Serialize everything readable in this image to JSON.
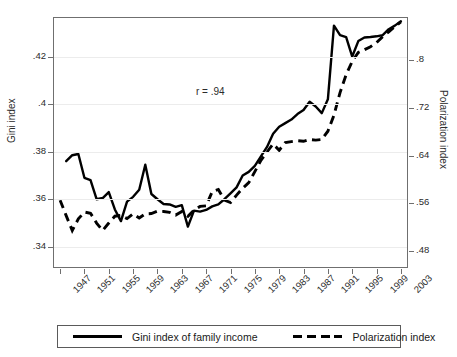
{
  "chart_data": {
    "type": "line",
    "title": "",
    "subtitle": "",
    "xlabel": "",
    "ylabel": "Gini index",
    "ylabel_secondary": "Polarization index",
    "grid": true,
    "legend_position": "bottom",
    "annotations": [
      {
        "name": "correlation",
        "text": "r = .94",
        "x": 1971,
        "y": 0.4045
      }
    ],
    "x": [
      1947,
      1948,
      1949,
      1950,
      1951,
      1952,
      1953,
      1954,
      1955,
      1956,
      1957,
      1958,
      1959,
      1960,
      1961,
      1962,
      1963,
      1964,
      1965,
      1966,
      1967,
      1968,
      1969,
      1970,
      1971,
      1972,
      1973,
      1974,
      1975,
      1976,
      1977,
      1978,
      1979,
      1980,
      1981,
      1982,
      1983,
      1984,
      1985,
      1986,
      1987,
      1988,
      1989,
      1990,
      1991,
      1992,
      1993,
      1994,
      1995,
      1996,
      1997,
      1998,
      1999,
      2000,
      2001,
      2002,
      2003
    ],
    "xtick_labels": [
      "1947",
      "1951",
      "1955",
      "1959",
      "1963",
      "1967",
      "1971",
      "1975",
      "1979",
      "1983",
      "1987",
      "1991",
      "1995",
      "1999",
      "2003"
    ],
    "xtick_values": [
      1947,
      1951,
      1955,
      1959,
      1963,
      1967,
      1971,
      1975,
      1979,
      1983,
      1987,
      1991,
      1995,
      1999,
      2003
    ],
    "xlim": [
      1946,
      2004
    ],
    "axes": [
      {
        "name": "left-axis",
        "label": "Gini index",
        "ylim": [
          0.3315,
          0.4362
        ],
        "ytick_labels": [
          ".42",
          ".4",
          ".38",
          ".36",
          ".34"
        ],
        "ytick_values": [
          0.42,
          0.4,
          0.38,
          0.36,
          0.34
        ]
      },
      {
        "name": "right-axis",
        "label": "Polarization index",
        "ylim": [
          0.4526,
          0.8714
        ],
        "ytick_labels": [
          ".8",
          ".72",
          ".64",
          ".56",
          ".48"
        ],
        "ytick_values": [
          0.8,
          0.72,
          0.64,
          0.56,
          0.48
        ]
      }
    ],
    "series": [
      {
        "name": "Gini index of family income",
        "axis": "left",
        "style": "solid",
        "color": "#000000",
        "start_year": 1948,
        "values": [
          null,
          0.376,
          0.3785,
          0.379,
          0.369,
          0.368,
          0.36,
          0.3605,
          0.363,
          0.3557,
          0.3508,
          0.359,
          0.361,
          0.364,
          0.3745,
          0.3622,
          0.36,
          0.358,
          0.3578,
          0.3568,
          0.3575,
          0.3485,
          0.3552,
          0.3548,
          0.3555,
          0.357,
          0.3578,
          0.36,
          0.3625,
          0.365,
          0.37,
          0.3715,
          0.374,
          0.378,
          0.382,
          0.3875,
          0.3905,
          0.392,
          0.3935,
          0.3958,
          0.3975,
          0.401,
          0.399,
          0.3962,
          0.402,
          0.433,
          0.429,
          0.4282,
          0.42,
          0.4265,
          0.428,
          0.4282,
          0.4285,
          0.429,
          0.4315,
          0.433,
          0.4348
        ]
      },
      {
        "name": "Polarization index",
        "axis": "right",
        "style": "dashed",
        "color": "#000000",
        "start_year": 1947,
        "values": [
          0.565,
          0.539,
          0.514,
          0.5335,
          0.545,
          0.543,
          0.5265,
          0.514,
          0.5265,
          0.538,
          0.5395,
          0.534,
          0.542,
          0.535,
          0.542,
          0.5425,
          0.5465,
          0.546,
          0.5445,
          0.54,
          0.546,
          0.538,
          0.548,
          0.5545,
          0.5555,
          0.5795,
          0.583,
          0.565,
          0.561,
          0.5735,
          0.585,
          0.5945,
          0.613,
          0.632,
          0.646,
          0.6595,
          0.649,
          0.662,
          0.6635,
          0.665,
          0.664,
          0.667,
          0.666,
          0.667,
          0.681,
          0.708,
          0.746,
          0.776,
          0.7985,
          0.8135,
          0.818,
          0.823,
          0.83,
          0.84,
          0.848,
          0.857,
          0.865
        ]
      }
    ]
  },
  "legend": {
    "entries": [
      {
        "label": "Gini index of family income",
        "style": "solid"
      },
      {
        "label": "Polarization index",
        "style": "dashed"
      }
    ]
  }
}
